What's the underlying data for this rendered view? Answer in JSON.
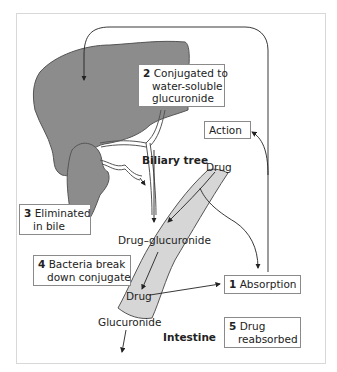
{
  "diagram": {
    "colors": {
      "liver": "#8c8c8c",
      "gallbladder": "#8c8c8c",
      "intestine": "#d6d6d6",
      "outline": "#444444",
      "box_border": "#8a8a8a",
      "frame": "#d8d8d8"
    },
    "steps": [
      {
        "number": "1",
        "text": "Absorption"
      },
      {
        "number": "2",
        "line1": "Conjugated to",
        "line2": "water-soluble",
        "line3": "glucuronide"
      },
      {
        "number": "3",
        "line1": "Eliminated",
        "line2": "in bile"
      },
      {
        "number": "4",
        "line1": "Bacteria break",
        "line2": "down conjugate"
      },
      {
        "number": "5",
        "line1": "Drug",
        "line2": "reabsorbed"
      }
    ],
    "labels": {
      "action": "Action",
      "biliary_tree": "Biliary tree",
      "drug_top": "Drug",
      "drug_glucuronide": "Drug–glucuronide",
      "drug_bottom": "Drug",
      "glucuronide": "Glucuronide",
      "intestine": "Intestine"
    }
  }
}
